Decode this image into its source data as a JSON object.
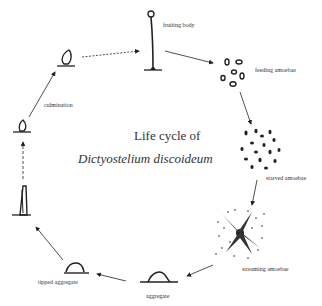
{
  "diagram": {
    "title_line1": "Life cycle of",
    "title_line2": "Dictyostelium discoideum",
    "stages": [
      {
        "id": "fruiting-body",
        "label": "fruiting body"
      },
      {
        "id": "feeding-amoebae",
        "label": "feeding amoebae"
      },
      {
        "id": "starved-amoebae",
        "label": "starved amoebae"
      },
      {
        "id": "streaming-amoebae",
        "label": "streaming amoebae"
      },
      {
        "id": "aggregate",
        "label": "aggregate"
      },
      {
        "id": "tipped-aggregate",
        "label": "tipped aggregate"
      },
      {
        "id": "slug",
        "label": ""
      },
      {
        "id": "early-culmination",
        "label": ""
      },
      {
        "id": "culmination",
        "label": "culmination"
      }
    ]
  }
}
